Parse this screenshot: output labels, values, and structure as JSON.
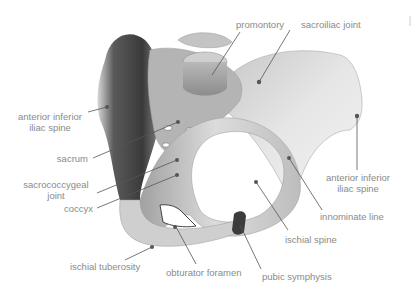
{
  "figure": {
    "label_color": "#8a8a8a",
    "leader_color": "#555555",
    "marker_color": "#555555"
  },
  "labels": {
    "promontory": "promontory",
    "sacroiliac_joint": "sacroiliac joint",
    "anterior_inferior_iliac_spine_left_1": "anterior inferior",
    "anterior_inferior_iliac_spine_left_2": "iliac spine",
    "sacrum": "sacrum",
    "sacrococcygeal_joint_1": "sacrococcygeal",
    "sacrococcygeal_joint_2": "joint",
    "coccyx": "coccyx",
    "ischial_tuberosity": "ischial tuberosity",
    "obturator_foramen": "obturator foramen",
    "pubic_symphysis": "pubic symphysis",
    "ischial_spine": "ischial spine",
    "innominate_line": "innominate line",
    "anterior_inferior_iliac_spine_right_1": "anterior inferior",
    "anterior_inferior_iliac_spine_right_2": "iliac spine"
  }
}
